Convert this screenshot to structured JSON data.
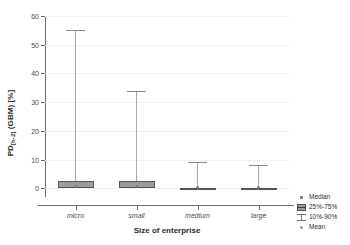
{
  "chart_data": {
    "type": "box",
    "title": "",
    "xlabel": "Size of enterprise",
    "ylabel": "PD (GBM) [%]",
    "ylabel_prefix": "PD",
    "ylabel_subscript": "[h-2]",
    "ylabel_suffix": " (GBM) [%]",
    "categories": [
      "micro",
      "small",
      "medium",
      "large"
    ],
    "ylim": [
      -3,
      60
    ],
    "yticks": [
      0,
      10,
      20,
      30,
      40,
      50,
      60
    ],
    "ytick_labels": [
      "0",
      "10",
      "20",
      "30",
      "40",
      "50",
      "60"
    ],
    "grid": true,
    "legend_position": "right-bottom",
    "series": [
      {
        "name": "micro",
        "whisker_low": 0.0,
        "q1": 0.2,
        "median": 0.4,
        "mean": 0.5,
        "q3": 2.4,
        "whisker_high": 55.0
      },
      {
        "name": "small",
        "whisker_low": 0.0,
        "q1": 0.2,
        "median": 0.4,
        "mean": 0.5,
        "q3": 2.4,
        "whisker_high": 34.0
      },
      {
        "name": "medium",
        "whisker_low": 0.0,
        "q1": 0.0,
        "median": 0.1,
        "mean": 0.2,
        "q3": 0.3,
        "whisker_high": 9.3
      },
      {
        "name": "large",
        "whisker_low": 0.0,
        "q1": 0.0,
        "median": 0.1,
        "mean": 0.2,
        "q3": 0.3,
        "whisker_high": 8.0
      }
    ],
    "legend": [
      {
        "label": "Median",
        "key": "median-marker"
      },
      {
        "label": "25%-75%",
        "key": "box-marker"
      },
      {
        "label": "10%-90%",
        "key": "whisker-marker"
      },
      {
        "label": "Mean",
        "key": "mean-marker"
      }
    ]
  },
  "colors": {
    "box_fill": "#9b9b9b",
    "box_edge": "#585858",
    "whisker": "#a8a8a8",
    "axis": "#6e6e6e",
    "grid": "#f0f0f0",
    "text": "#2b2b2b",
    "background": "#ffffff"
  }
}
